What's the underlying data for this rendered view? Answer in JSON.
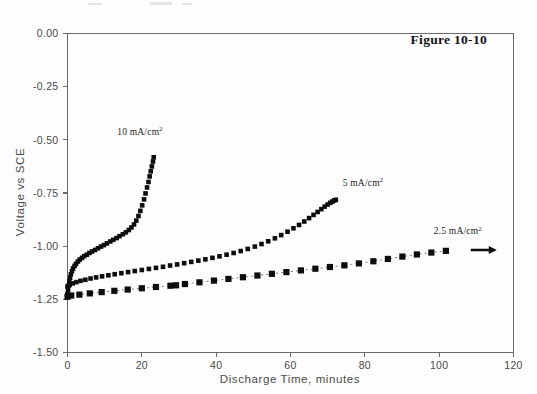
{
  "figure": {
    "title": "Figure 10-10",
    "background_color": "#fdfdfd",
    "ink_color": "#0d0d0d",
    "axis_color": "#6a6a6a"
  },
  "chart_data": {
    "type": "line",
    "title": "Figure 10-10",
    "xlabel": "Discharge Time,  minutes",
    "ylabel": "Voltage vs SCE",
    "xlim": [
      0,
      120
    ],
    "ylim": [
      -1.5,
      0.0
    ],
    "xticks": [
      0,
      20,
      40,
      60,
      80,
      100,
      120
    ],
    "yticks": [
      0.0,
      -0.25,
      -0.5,
      -0.75,
      -1.0,
      -1.25,
      -1.5
    ],
    "xticklabels": [
      "0",
      "20",
      "40",
      "60",
      "80",
      "100",
      "120"
    ],
    "yticklabels": [
      "0.00",
      "-0.25",
      "-0.50",
      "-0.75",
      "-1.00",
      "-1.25",
      "-1.50"
    ],
    "grid": false,
    "legend_position": "inline-annotations",
    "annotations": [
      {
        "name": "label-10-ma",
        "text": "10 mA/cm",
        "superscript": "2",
        "x": 19.5,
        "y": -0.475
      },
      {
        "name": "label-5-ma",
        "text": "5 mA/cm",
        "superscript": "2",
        "x": 79.5,
        "y": -0.715
      },
      {
        "name": "label-2-5-ma",
        "text": "2.5 mA/cm",
        "superscript": "2",
        "x": 105.0,
        "y": -0.945
      }
    ],
    "arrow": {
      "name": "continues-arrow",
      "x_start": 108.5,
      "x_end": 115.5,
      "y": -1.018
    },
    "series": [
      {
        "name": "10 mA/cm2",
        "marker": "square",
        "marker_size": 4.6,
        "style": "dense-solid",
        "x": [
          0.0,
          0.15,
          0.3,
          0.5,
          0.7,
          0.9,
          1.2,
          1.5,
          1.9,
          2.3,
          2.8,
          3.3,
          3.9,
          4.5,
          5.2,
          5.9,
          6.6,
          7.4,
          8.2,
          9.0,
          9.8,
          10.6,
          11.5,
          12.3,
          13.2,
          14.0,
          14.9,
          15.7,
          16.5,
          17.2,
          17.9,
          18.5,
          19.1,
          19.6,
          20.1,
          20.6,
          21.0,
          21.4,
          21.8,
          22.1,
          22.4,
          22.7,
          23.0,
          23.2
        ],
        "y": [
          -1.225,
          -1.205,
          -1.185,
          -1.165,
          -1.148,
          -1.132,
          -1.118,
          -1.105,
          -1.093,
          -1.083,
          -1.072,
          -1.063,
          -1.055,
          -1.047,
          -1.04,
          -1.032,
          -1.025,
          -1.018,
          -1.01,
          -1.002,
          -0.995,
          -0.987,
          -0.978,
          -0.97,
          -0.962,
          -0.953,
          -0.944,
          -0.935,
          -0.924,
          -0.912,
          -0.898,
          -0.88,
          -0.858,
          -0.834,
          -0.808,
          -0.78,
          -0.752,
          -0.724,
          -0.698,
          -0.672,
          -0.648,
          -0.625,
          -0.602,
          -0.582
        ]
      },
      {
        "name": "5 mA/cm2",
        "marker": "square",
        "marker_size": 4.6,
        "style": "dense-solid",
        "x": [
          0.0,
          0.6,
          1.4,
          2.4,
          3.5,
          4.8,
          6.2,
          7.7,
          9.3,
          11.0,
          12.7,
          14.5,
          16.3,
          18.1,
          20.0,
          21.9,
          23.8,
          25.7,
          27.6,
          29.5,
          31.4,
          33.3,
          35.2,
          37.1,
          39.0,
          40.9,
          42.8,
          44.7,
          46.6,
          48.5,
          50.4,
          52.2,
          54.0,
          55.8,
          57.5,
          59.2,
          60.8,
          62.3,
          63.7,
          65.0,
          66.2,
          67.3,
          68.3,
          69.2,
          70.0,
          70.7,
          71.3,
          71.8,
          72.2
        ],
        "y": [
          -1.19,
          -1.182,
          -1.175,
          -1.169,
          -1.163,
          -1.158,
          -1.152,
          -1.147,
          -1.142,
          -1.137,
          -1.132,
          -1.127,
          -1.122,
          -1.117,
          -1.112,
          -1.107,
          -1.102,
          -1.097,
          -1.091,
          -1.086,
          -1.08,
          -1.074,
          -1.068,
          -1.062,
          -1.055,
          -1.048,
          -1.04,
          -1.032,
          -1.023,
          -1.013,
          -1.002,
          -0.99,
          -0.977,
          -0.963,
          -0.948,
          -0.932,
          -0.916,
          -0.9,
          -0.884,
          -0.868,
          -0.853,
          -0.839,
          -0.826,
          -0.814,
          -0.804,
          -0.796,
          -0.79,
          -0.785,
          -0.782
        ]
      },
      {
        "name": "2.5 mA/cm2",
        "marker": "square",
        "marker_size": 6.2,
        "style": "sparse-dashed",
        "x": [
          0.0,
          1.0,
          3.2,
          6.0,
          9.2,
          12.6,
          16.2,
          20.0,
          23.8,
          27.7,
          29.2,
          31.6,
          35.5,
          39.4,
          43.3,
          47.2,
          51.1,
          55.0,
          58.9,
          62.8,
          66.7,
          70.6,
          74.5,
          78.4,
          82.3,
          86.2,
          90.1,
          94.0,
          97.9,
          101.8
        ],
        "y": [
          -1.238,
          -1.232,
          -1.228,
          -1.222,
          -1.216,
          -1.21,
          -1.204,
          -1.198,
          -1.192,
          -1.186,
          -1.184,
          -1.178,
          -1.17,
          -1.162,
          -1.154,
          -1.146,
          -1.138,
          -1.13,
          -1.122,
          -1.114,
          -1.106,
          -1.098,
          -1.09,
          -1.081,
          -1.071,
          -1.06,
          -1.049,
          -1.039,
          -1.03,
          -1.022
        ]
      }
    ]
  }
}
